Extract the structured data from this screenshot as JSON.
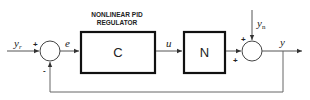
{
  "diagram": {
    "type": "block-diagram",
    "title_label": "NONLINEAR PID REGULATOR",
    "title_lines": [
      "NONLINEAR PID",
      "REGULATOR"
    ],
    "blocks": [
      {
        "id": "C",
        "label": "C",
        "description": "Nonlinear PID regulator"
      },
      {
        "id": "N",
        "label": "N",
        "description": "Plant"
      }
    ],
    "summing_junctions": [
      {
        "id": "sum1",
        "signs": {
          "left": "+",
          "bottom": "-"
        }
      },
      {
        "id": "sum2",
        "signs": {
          "top": "+",
          "left": "+"
        }
      }
    ],
    "signals": {
      "reference": {
        "symbol": "y",
        "subscript": "r"
      },
      "error": {
        "symbol": "e"
      },
      "control": {
        "symbol": "u"
      },
      "noise": {
        "symbol": "y",
        "subscript": "n"
      },
      "output": {
        "symbol": "y"
      }
    },
    "edges": [
      {
        "from": "reference",
        "to": "sum1"
      },
      {
        "from": "sum1",
        "to": "C",
        "signal": "e"
      },
      {
        "from": "C",
        "to": "N",
        "signal": "u"
      },
      {
        "from": "N",
        "to": "sum2"
      },
      {
        "from": "noise",
        "to": "sum2"
      },
      {
        "from": "sum2",
        "to": "output",
        "signal": "y"
      },
      {
        "from": "output",
        "to": "sum1",
        "type": "feedback"
      }
    ],
    "colors": {
      "line": "#555555",
      "block_border": "#111111",
      "text": "#222222"
    }
  }
}
